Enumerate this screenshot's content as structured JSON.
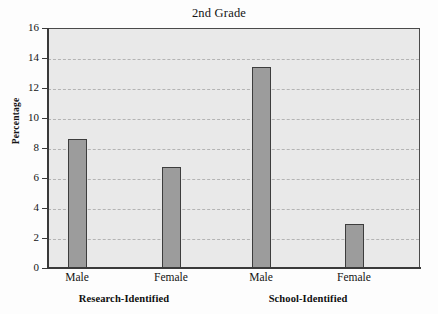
{
  "chart_data": {
    "type": "bar",
    "title": "2nd Grade",
    "xlabel": "",
    "ylabel": "Percentage",
    "ylim": [
      0,
      16
    ],
    "ytick_labels": [
      "0",
      "2",
      "4",
      "6",
      "8",
      "10",
      "12",
      "14",
      "16"
    ],
    "ytick_values": [
      0,
      2,
      4,
      6,
      8,
      10,
      12,
      14,
      16
    ],
    "grid": true,
    "grid_axis": "y",
    "grid_style": "dashed",
    "legend": "none",
    "categories": [
      "Male",
      "Female",
      "Male",
      "Female"
    ],
    "values": [
      8.7,
      6.8,
      13.5,
      3.0
    ],
    "groups": [
      {
        "name": "Research-Identified",
        "categories": [
          "Male",
          "Female"
        ],
        "values": [
          8.7,
          6.8
        ]
      },
      {
        "name": "School-Identified",
        "categories": [
          "Male",
          "Female"
        ],
        "values": [
          13.5,
          3.0
        ]
      }
    ],
    "bar_fill_color": "#9c9c9c",
    "bar_edge_color": "#3d3d3d",
    "plot_background_color": "#e9e9e9",
    "figure_background_color": "#fdfdfd",
    "gridline_color": "#b4b4b4",
    "axis_color": "#3a3a3a"
  },
  "axis": {
    "y_title": "Percentage",
    "ticks": [
      {
        "label": "16",
        "value": 16
      },
      {
        "label": "14",
        "value": 14
      },
      {
        "label": "12",
        "value": 12
      },
      {
        "label": "10",
        "value": 10
      },
      {
        "label": "8",
        "value": 8
      },
      {
        "label": "6",
        "value": 6
      },
      {
        "label": "4",
        "value": 4
      },
      {
        "label": "2",
        "value": 2
      },
      {
        "label": "0",
        "value": 0
      }
    ]
  },
  "bars": [
    {
      "label": "Male",
      "value": 8.7,
      "group": "Research-Identified"
    },
    {
      "label": "Female",
      "value": 6.8,
      "group": "Research-Identified"
    },
    {
      "label": "Male",
      "value": 13.5,
      "group": "School-Identified"
    },
    {
      "label": "Female",
      "value": 3.0,
      "group": "School-Identified"
    }
  ],
  "groups": [
    {
      "label": "Research-Identified"
    },
    {
      "label": "School-Identified"
    }
  ],
  "title": "2nd Grade"
}
